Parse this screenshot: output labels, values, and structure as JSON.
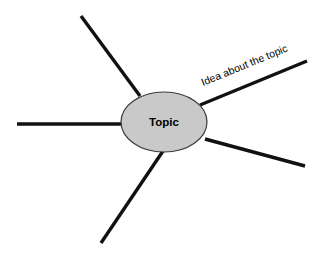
{
  "diagram": {
    "type": "mind-map",
    "background_color": "#ffffff",
    "canvas": {
      "width": 328,
      "height": 258
    },
    "center_node": {
      "label": "Topic",
      "shape": "ellipse",
      "fill_color": "#c9c9c9",
      "stroke_color": "#3a3a3a",
      "cx": 164,
      "cy": 122,
      "rx": 43,
      "ry": 30,
      "label_x": 164,
      "label_y": 123
    },
    "branches": [
      {
        "name": "branch-top-left",
        "label": "",
        "color": "#111111",
        "width": 3.4,
        "x1": 140,
        "y1": 96,
        "x2": 81,
        "y2": 16
      },
      {
        "name": "branch-left",
        "label": "",
        "color": "#111111",
        "width": 3.4,
        "x1": 122,
        "y1": 124,
        "x2": 17,
        "y2": 124
      },
      {
        "name": "branch-bottom-left",
        "label": "",
        "color": "#111111",
        "width": 3.4,
        "x1": 163,
        "y1": 151,
        "x2": 101,
        "y2": 243
      },
      {
        "name": "branch-bottom-right",
        "label": "",
        "color": "#111111",
        "width": 3.4,
        "x1": 205,
        "y1": 139,
        "x2": 305,
        "y2": 166
      },
      {
        "name": "branch-top-right",
        "label": "Idea about the topic",
        "color": "#111111",
        "width": 3.4,
        "x1": 200,
        "y1": 105,
        "x2": 307,
        "y2": 61,
        "label_x": 203,
        "label_y": 86,
        "label_rotation": -22.3
      }
    ]
  }
}
